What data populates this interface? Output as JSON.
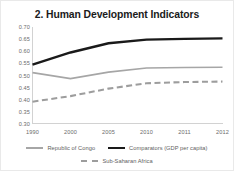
{
  "chart_data": {
    "type": "line",
    "title": "2. Human Development Indicators",
    "xlabel": "",
    "ylabel": "",
    "categories": [
      "1990",
      "2000",
      "2005",
      "2010",
      "2011",
      "2012"
    ],
    "ylim": [
      0.3,
      0.7
    ],
    "yticks": [
      "0.70",
      "0.65",
      "0.60",
      "0.55",
      "0.50",
      "0.45",
      "0.40",
      "0.35",
      "0.30"
    ],
    "ytick_values": [
      0.7,
      0.65,
      0.6,
      0.55,
      0.5,
      0.45,
      0.4,
      0.35,
      0.3
    ],
    "grid": false,
    "legend_position": "bottom",
    "series": [
      {
        "name": "Republic of Congo",
        "style": "solid",
        "color": "#a6a6a6",
        "width": 1.6,
        "values": [
          0.512,
          0.487,
          0.514,
          0.531,
          0.533,
          0.534
        ]
      },
      {
        "name": "Comparators (GDP per capita)",
        "style": "solid",
        "color": "#1a1a1a",
        "width": 2.4,
        "values": [
          0.545,
          0.595,
          0.633,
          0.648,
          0.651,
          0.653
        ]
      },
      {
        "name": "Sub-Saharan Africa",
        "style": "dashed",
        "color": "#9d9d9d",
        "width": 2.1,
        "values": [
          0.392,
          0.415,
          0.446,
          0.468,
          0.473,
          0.475
        ]
      }
    ]
  },
  "legend": {
    "row1": [
      {
        "label": "Republic of Congo",
        "swatch": "solid-gray"
      },
      {
        "label": "Comparators (GDP per capita)",
        "swatch": "solid-dark"
      }
    ],
    "row2": [
      {
        "label": "Sub-Saharan Africa",
        "swatch": "dashed-gray"
      }
    ]
  },
  "colors": {
    "comparators": "#1a1a1a",
    "congo": "#a6a6a6",
    "ssa": "#9d9d9d",
    "axis": "#d2d2d2",
    "tick_text": "#6b6b6b",
    "title_text": "#1b1b1b",
    "background": "#ffffff"
  }
}
